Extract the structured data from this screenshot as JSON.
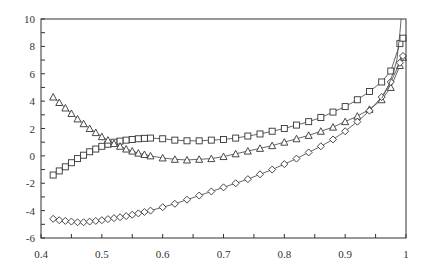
{
  "chart_data": {
    "type": "line",
    "title": "",
    "xlabel": "",
    "ylabel": "",
    "xlim": [
      0.4,
      1.0
    ],
    "ylim": [
      -6,
      10
    ],
    "x_ticks": [
      0.4,
      0.5,
      0.6,
      0.7,
      0.8,
      0.9,
      1
    ],
    "x_tick_labels": [
      "0.4",
      "0.5",
      "0.6",
      "0.7",
      "0.8",
      "0.9",
      "1"
    ],
    "x_minor_step": 0.05,
    "y_ticks": [
      -6,
      -4,
      -2,
      0,
      2,
      4,
      6,
      8,
      10
    ],
    "y_tick_labels": [
      "-6",
      "-4",
      "-2",
      "0",
      "2",
      "4",
      "6",
      "8",
      "10"
    ],
    "y_minor_step": 1,
    "grid": false,
    "legend": null,
    "series": [
      {
        "name": "squares",
        "marker": "square",
        "x": [
          0.42,
          0.43,
          0.44,
          0.45,
          0.46,
          0.47,
          0.48,
          0.49,
          0.5,
          0.51,
          0.52,
          0.53,
          0.54,
          0.55,
          0.56,
          0.57,
          0.58,
          0.6,
          0.62,
          0.64,
          0.66,
          0.68,
          0.7,
          0.72,
          0.74,
          0.76,
          0.78,
          0.8,
          0.82,
          0.84,
          0.86,
          0.88,
          0.9,
          0.92,
          0.94,
          0.96,
          0.975,
          0.99,
          0.995
        ],
        "y": [
          -1.4,
          -1.1,
          -0.8,
          -0.5,
          -0.2,
          0.05,
          0.3,
          0.5,
          0.7,
          0.85,
          1.0,
          1.08,
          1.15,
          1.2,
          1.25,
          1.28,
          1.3,
          1.25,
          1.15,
          1.1,
          1.1,
          1.15,
          1.2,
          1.3,
          1.45,
          1.6,
          1.8,
          2.0,
          2.25,
          2.5,
          2.8,
          3.2,
          3.6,
          4.1,
          4.7,
          5.4,
          6.2,
          8.2,
          8.6
        ]
      },
      {
        "name": "triangles",
        "marker": "triangle",
        "x": [
          0.42,
          0.43,
          0.44,
          0.45,
          0.46,
          0.47,
          0.48,
          0.49,
          0.5,
          0.51,
          0.52,
          0.53,
          0.54,
          0.55,
          0.56,
          0.57,
          0.58,
          0.6,
          0.62,
          0.64,
          0.66,
          0.68,
          0.7,
          0.72,
          0.74,
          0.76,
          0.78,
          0.8,
          0.82,
          0.84,
          0.86,
          0.88,
          0.9,
          0.92,
          0.94,
          0.96,
          0.975,
          0.99,
          0.995
        ],
        "y": [
          4.3,
          3.9,
          3.5,
          3.1,
          2.7,
          2.35,
          2.0,
          1.7,
          1.4,
          1.15,
          0.9,
          0.7,
          0.5,
          0.35,
          0.2,
          0.1,
          0.0,
          -0.15,
          -0.25,
          -0.3,
          -0.25,
          -0.2,
          -0.05,
          0.15,
          0.35,
          0.55,
          0.75,
          1.0,
          1.25,
          1.5,
          1.8,
          2.1,
          2.5,
          2.9,
          3.4,
          4.1,
          5.0,
          6.6,
          7.2
        ]
      },
      {
        "name": "diamonds",
        "marker": "diamond",
        "x": [
          0.42,
          0.43,
          0.44,
          0.45,
          0.46,
          0.47,
          0.48,
          0.49,
          0.5,
          0.51,
          0.52,
          0.53,
          0.54,
          0.55,
          0.56,
          0.57,
          0.58,
          0.6,
          0.62,
          0.64,
          0.66,
          0.68,
          0.7,
          0.72,
          0.74,
          0.76,
          0.78,
          0.8,
          0.82,
          0.84,
          0.86,
          0.88,
          0.9,
          0.92,
          0.94,
          0.96,
          0.975,
          0.99,
          0.995
        ],
        "y": [
          -4.6,
          -4.7,
          -4.75,
          -4.8,
          -4.85,
          -4.85,
          -4.8,
          -4.75,
          -4.7,
          -4.62,
          -4.55,
          -4.48,
          -4.4,
          -4.3,
          -4.2,
          -4.1,
          -4.0,
          -3.75,
          -3.5,
          -3.2,
          -2.9,
          -2.6,
          -2.3,
          -2.0,
          -1.7,
          -1.35,
          -1.0,
          -0.6,
          -0.2,
          0.25,
          0.7,
          1.2,
          1.8,
          2.5,
          3.3,
          4.3,
          5.4,
          6.8,
          7.3
        ]
      },
      {
        "name": "solid-line",
        "marker": "none",
        "x": [
          0.96,
          0.97,
          0.975,
          0.98,
          0.985,
          0.99,
          0.992
        ],
        "y": [
          4.2,
          5.0,
          5.6,
          6.2,
          7.0,
          9.0,
          10.0
        ]
      }
    ]
  },
  "style": {
    "line_color": "#555555",
    "axis_color": "#333333",
    "marker_fill": "#ffffff",
    "background": "#ffffff"
  }
}
